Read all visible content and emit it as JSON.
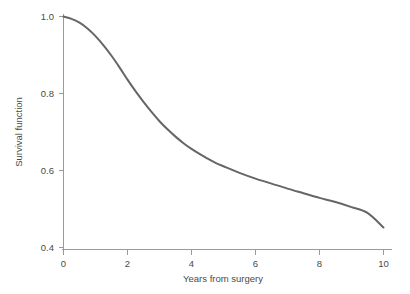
{
  "chart_data": {
    "type": "line",
    "title": "",
    "subtitle": "",
    "xlabel": "Years from surgery",
    "ylabel": "Survival function",
    "xlim": [
      0,
      10
    ],
    "ylim": [
      0.4,
      1.0
    ],
    "xticks": [
      "0",
      "2",
      "4",
      "6",
      "8",
      "10"
    ],
    "xtick_values": [
      0,
      2,
      4,
      6,
      8,
      10
    ],
    "yticks": [
      "0.4",
      "0.6",
      "0.8",
      "1.0"
    ],
    "ytick_values": [
      0.4,
      0.6,
      0.8,
      1.0
    ],
    "grid": false,
    "legend": null,
    "legend_position": "none",
    "annotations": [],
    "line_color": "#666666",
    "axis_color": "#9a9a9a",
    "text_color": "#4a4a4a",
    "background_color": "#ffffff",
    "series": [
      {
        "name": "Survival function",
        "x": [
          0.0,
          0.25,
          0.5,
          0.75,
          1.0,
          1.25,
          1.5,
          1.75,
          2.0,
          2.25,
          2.5,
          2.75,
          3.0,
          3.25,
          3.5,
          3.75,
          4.0,
          4.25,
          4.5,
          4.75,
          5.0,
          5.5,
          6.0,
          6.5,
          7.0,
          7.5,
          8.0,
          8.5,
          9.0,
          9.5,
          10.0
        ],
        "values": [
          1.0,
          0.994,
          0.984,
          0.969,
          0.949,
          0.925,
          0.898,
          0.868,
          0.836,
          0.806,
          0.778,
          0.752,
          0.728,
          0.707,
          0.688,
          0.671,
          0.656,
          0.643,
          0.631,
          0.62,
          0.611,
          0.594,
          0.579,
          0.566,
          0.553,
          0.541,
          0.529,
          0.518,
          0.505,
          0.49,
          0.452
        ]
      }
    ]
  },
  "axes": {
    "x_axis_name": "x-axis",
    "y_axis_name": "y-axis"
  }
}
